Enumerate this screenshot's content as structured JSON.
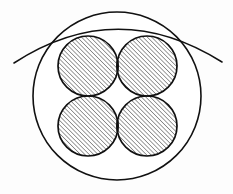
{
  "figure": {
    "kind": "technical-line-drawing",
    "canvas": {
      "width": 233,
      "height": 194,
      "background": "#fdfdfd"
    },
    "style": {
      "stroke_color": "#111111",
      "fill_color": "#ffffff",
      "hatch_color": "#1a1a1a",
      "outer_circle_stroke_width": 1.6,
      "inner_circle_stroke_width": 1.7,
      "arc_stroke_width": 1.5,
      "hatch_stroke_width": 0.85,
      "hatch_spacing": 3.1,
      "hatch_angle_deg": 45
    },
    "outer_circle": {
      "label": "outer-circle",
      "cx": 117,
      "cy": 96,
      "r": 84
    },
    "tangent_arc": {
      "label": "tangent-arc",
      "path": "M 14 63 Q 117 -4 222 62",
      "start": {
        "x": 14,
        "y": 63
      },
      "control": {
        "x": 117,
        "y": -4
      },
      "end": {
        "x": 222,
        "y": 62
      }
    },
    "hatched_circles": [
      {
        "label": "top-left-circle",
        "cx": 88,
        "cy": 66,
        "r": 30
      },
      {
        "label": "top-right-circle",
        "cx": 147,
        "cy": 66,
        "r": 30
      },
      {
        "label": "bottom-left-circle",
        "cx": 88,
        "cy": 126,
        "r": 30
      },
      {
        "label": "bottom-right-circle",
        "cx": 147,
        "cy": 126,
        "r": 30
      }
    ],
    "lens_overlaps": [
      {
        "label": "lens-top",
        "a": "top-left-circle",
        "b": "top-right-circle"
      },
      {
        "label": "lens-bottom",
        "a": "bottom-left-circle",
        "b": "bottom-right-circle"
      },
      {
        "label": "lens-left",
        "a": "top-left-circle",
        "b": "bottom-left-circle"
      },
      {
        "label": "lens-right",
        "a": "top-right-circle",
        "b": "bottom-right-circle"
      }
    ]
  }
}
